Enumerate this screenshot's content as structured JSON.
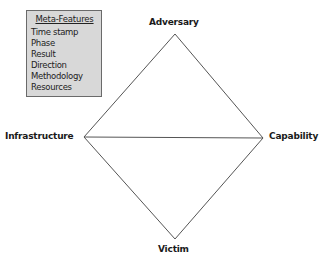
{
  "meta_features": {
    "title": "Meta-Features",
    "items": [
      "Time stamp",
      "Phase",
      "Result",
      "Direction",
      "Methodology",
      "Resources"
    ]
  },
  "vertices": {
    "top": "Adversary",
    "left": "Infrastructure",
    "right": "Capability",
    "bottom": "Victim"
  },
  "colors": {
    "box_fill": "#d8d8d8",
    "box_border": "#6a6a6a",
    "line": "#555555",
    "text": "#1a1a1a"
  }
}
